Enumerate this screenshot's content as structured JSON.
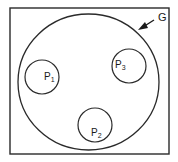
{
  "diagram": {
    "type": "set-containment",
    "colors": {
      "stroke": "#2a2a2a",
      "background": "#ffffff"
    },
    "frame": {
      "x": 10,
      "y": 8,
      "width": 159,
      "height": 146
    },
    "container": {
      "label": "G",
      "cx": 88.5,
      "cy": 82,
      "rx": 70.5,
      "ry": 68,
      "label_pos": {
        "x": 157,
        "y": 12
      },
      "arrow": {
        "x1": 154,
        "y1": 20,
        "x2": 139,
        "y2": 29
      }
    },
    "subsets": [
      {
        "id": "p1",
        "label_main": "P",
        "label_sub": "1",
        "cx": 42,
        "cy": 77,
        "r": 17,
        "label_pos": {
          "x": 44,
          "y": 73
        }
      },
      {
        "id": "p2",
        "label_main": "P",
        "label_sub": "2",
        "cx": 95,
        "cy": 125,
        "r": 17,
        "label_pos": {
          "x": 91,
          "y": 128
        }
      },
      {
        "id": "p3",
        "label_main": "P",
        "label_sub": "3",
        "cx": 129,
        "cy": 66,
        "r": 17,
        "label_pos": {
          "x": 115,
          "y": 60
        }
      }
    ]
  }
}
